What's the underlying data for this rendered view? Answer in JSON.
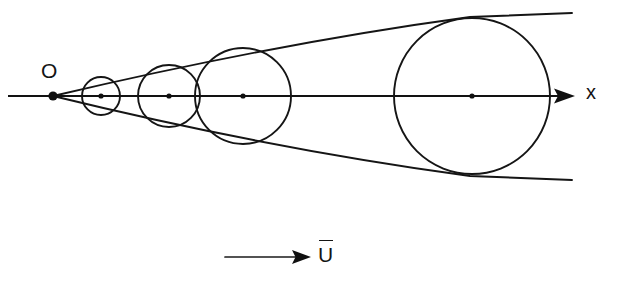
{
  "figure": {
    "background_color": "#ffffff",
    "stroke_color": "#151515",
    "width": 618,
    "height": 285
  },
  "labels": {
    "origin": "O",
    "axis_x": "x",
    "velocity": "U",
    "velocity_overbar": true
  },
  "chart_data": {
    "type": "scatter",
    "xlabel": "x",
    "ylabel": "",
    "grid": false,
    "legend": null,
    "xlim": [
      0,
      618
    ],
    "ylim": [
      0,
      285
    ],
    "axis": {
      "name": "x-axis",
      "y": 96,
      "x_start": 8,
      "x_end": 575,
      "arrow": "right",
      "label": "x"
    },
    "origin": {
      "name": "O",
      "x": 53,
      "y": 96,
      "marker": "filled-circle",
      "marker_radius": 4.6
    },
    "circles": [
      {
        "name": "wavefront-1",
        "cx": 101,
        "cy": 96,
        "r": 19,
        "center_marker_radius": 2.6
      },
      {
        "name": "wavefront-2",
        "cx": 169,
        "cy": 96,
        "r": 31,
        "center_marker_radius": 2.6
      },
      {
        "name": "wavefront-3",
        "cx": 243,
        "cy": 96,
        "r": 48,
        "center_marker_radius": 2.6
      },
      {
        "name": "wavefront-4",
        "cx": 472,
        "cy": 96,
        "r": 78,
        "center_marker_radius": 2.6
      }
    ],
    "envelopes": [
      {
        "name": "upper-envelope",
        "path": "M 53 96 C 180 66, 330 36, 470 17 L 572 13",
        "description": "upper tangent line (Mach line) from origin through circle tops"
      },
      {
        "name": "lower-envelope",
        "path": "M 53 96 C 180 127, 330 157, 470 176 L 572 180",
        "description": "lower tangent line (Mach line) from origin through circle bottoms"
      }
    ],
    "velocity_arrow": {
      "name": "free-stream-velocity",
      "x_start": 225,
      "x_end": 311,
      "y": 257,
      "direction": "right",
      "label": "U",
      "overbar": true
    }
  }
}
